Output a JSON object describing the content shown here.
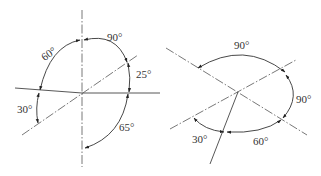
{
  "diagrams": [
    {
      "id": "left",
      "angles": [
        {
          "label": "90°",
          "x": 107,
          "y": 41
        },
        {
          "label": "60°",
          "x": 42,
          "y": 55
        },
        {
          "label": "25°",
          "x": 136,
          "y": 78
        },
        {
          "label": "30°",
          "x": 17,
          "y": 113
        },
        {
          "label": "65°",
          "x": 119,
          "y": 131
        }
      ]
    },
    {
      "id": "right",
      "angles": [
        {
          "label": "90°",
          "x": 234,
          "y": 49
        },
        {
          "label": "90°",
          "x": 296,
          "y": 103
        },
        {
          "label": "30°",
          "x": 192,
          "y": 143
        },
        {
          "label": "60°",
          "x": 253,
          "y": 145
        }
      ]
    }
  ],
  "colors": {
    "line": "#444444",
    "text": "#333333",
    "background": "#ffffff"
  }
}
